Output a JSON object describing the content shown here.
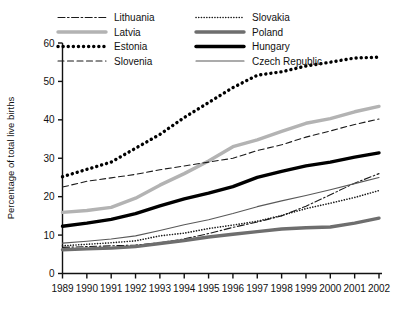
{
  "chart_data": {
    "type": "line",
    "title": "",
    "subtitle": "",
    "xlabel": "",
    "ylabel": "Percentage of total live births",
    "x": [
      1989,
      1990,
      1991,
      1992,
      1993,
      1994,
      1995,
      1996,
      1997,
      1998,
      1999,
      2000,
      2001,
      2002
    ],
    "categories": [
      "1989",
      "1990",
      "1991",
      "1992",
      "1993",
      "1994",
      "1995",
      "1996",
      "1997",
      "1998",
      "1999",
      "2000",
      "2001",
      "2002"
    ],
    "xlim": [
      1989,
      2002
    ],
    "ylim": [
      0,
      60
    ],
    "ytick_values": [
      0,
      10,
      20,
      30,
      40,
      50,
      60
    ],
    "ytick_labels": [
      "0",
      "10",
      "20",
      "30",
      "40",
      "50",
      "60"
    ],
    "grid": false,
    "legend_position": "top-inside",
    "legend_columns": 2,
    "series": [
      {
        "name": "Lithuania",
        "style": "dash-dot",
        "color": "#1a1a1a",
        "width": 1.1,
        "dasharray": "7,2.5,1.6,2.5",
        "values": [
          6.8,
          7.0,
          7.2,
          7.4,
          8.0,
          9.0,
          10.4,
          12.0,
          13.4,
          15.0,
          17.5,
          20.5,
          23.5,
          26.0
        ]
      },
      {
        "name": "Latvia",
        "style": "solid-thick",
        "color": "#b3b3b3",
        "width": 3.4,
        "dasharray": "",
        "values": [
          15.9,
          16.4,
          17.2,
          19.6,
          23.0,
          26.0,
          29.3,
          33.0,
          34.8,
          37.0,
          39.1,
          40.3,
          42.1,
          43.5
        ]
      },
      {
        "name": "Estonia",
        "style": "dotted-thick",
        "color": "#000000",
        "width": 3.4,
        "dasharray": "0.1,5.0",
        "values": [
          25.2,
          27.1,
          29.0,
          32.6,
          36.2,
          40.6,
          44.5,
          48.4,
          51.6,
          52.5,
          54.0,
          55.0,
          56.1,
          56.3
        ]
      },
      {
        "name": "Slovenia",
        "style": "dashed",
        "color": "#1a1a1a",
        "width": 1.1,
        "dasharray": "6,3.5",
        "values": [
          22.5,
          24.0,
          24.9,
          25.8,
          27.0,
          28.0,
          29.0,
          30.0,
          32.0,
          33.5,
          35.5,
          37.1,
          38.8,
          40.2
        ]
      },
      {
        "name": "Slovakia",
        "style": "dotted-fine",
        "color": "#1a1a1a",
        "width": 1.6,
        "dasharray": "0.1,2.6",
        "values": [
          7.2,
          7.6,
          8.0,
          8.5,
          9.8,
          10.5,
          11.7,
          12.6,
          13.6,
          15.1,
          16.9,
          18.3,
          19.8,
          21.6
        ]
      },
      {
        "name": "Poland",
        "style": "solid-thick",
        "color": "#6e6e6e",
        "width": 3.4,
        "dasharray": "",
        "values": [
          6.2,
          6.4,
          6.6,
          7.0,
          7.8,
          8.6,
          9.5,
          10.2,
          10.9,
          11.6,
          11.9,
          12.1,
          13.1,
          14.4
        ]
      },
      {
        "name": "Hungary",
        "style": "solid-thick",
        "color": "#000000",
        "width": 3.4,
        "dasharray": "",
        "values": [
          12.3,
          13.1,
          14.1,
          15.6,
          17.6,
          19.4,
          20.9,
          22.6,
          25.0,
          26.6,
          28.0,
          29.0,
          30.3,
          31.4
        ]
      },
      {
        "name": "Czech Republic",
        "style": "solid-thin",
        "color": "#595959",
        "width": 1.1,
        "dasharray": "",
        "values": [
          7.9,
          8.4,
          9.0,
          9.8,
          11.2,
          12.7,
          14.0,
          15.6,
          17.4,
          18.9,
          20.3,
          21.8,
          23.4,
          25.0
        ]
      }
    ]
  },
  "legend": {
    "entries": [
      {
        "label": "Lithuania"
      },
      {
        "label": "Slovakia"
      },
      {
        "label": "Latvia"
      },
      {
        "label": "Poland"
      },
      {
        "label": "Estonia"
      },
      {
        "label": "Hungary"
      },
      {
        "label": "Slovenia"
      },
      {
        "label": "Czech Republic"
      }
    ]
  },
  "axis": {
    "y_title": "Percentage of total live births"
  },
  "colors": {
    "axis": "#111111",
    "background": "#ffffff"
  }
}
